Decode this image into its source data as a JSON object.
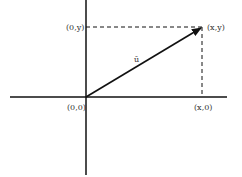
{
  "diagram": {
    "type": "vector-coordinate-plane",
    "vector_label": "ū",
    "points": {
      "origin": "(0,0)",
      "tip": "(x,y)",
      "y_projection": "(0,y)",
      "x_projection": "(x,0)"
    },
    "colors": {
      "line": "#111111",
      "text": "#333333",
      "background": "#ffffff"
    }
  }
}
